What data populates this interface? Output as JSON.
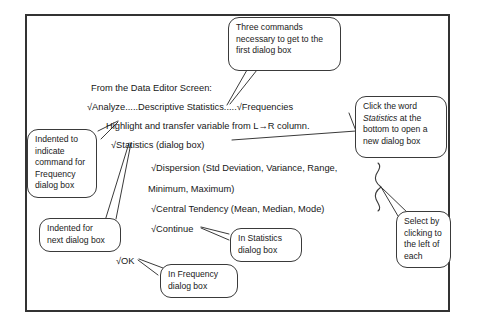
{
  "figure": {
    "background_color": "#ffffff",
    "frame_color": "#333333",
    "text_color": "#171717"
  },
  "body_lines": [
    {
      "id": "intro",
      "text": "From the Data Editor Screen:"
    },
    {
      "id": "commands",
      "text": "√Analyze.....Descriptive Statistics.....√Frequencies"
    },
    {
      "id": "highlight",
      "text": "Highlight and transfer variable from L→R column."
    },
    {
      "id": "statistics",
      "text": "√Statistics (dialog box)"
    },
    {
      "id": "dispersion",
      "text": "√Dispersion (Std Deviation, Variance, Range,"
    },
    {
      "id": "minmax",
      "text": "Minimum, Maximum)"
    },
    {
      "id": "central",
      "text": "√Central Tendency (Mean, Median, Mode)"
    },
    {
      "id": "continue",
      "text": "√Continue"
    },
    {
      "id": "ok",
      "text": "√OK"
    }
  ],
  "callouts": [
    {
      "id": "three-commands",
      "lines": [
        "Three commands",
        "necessary to get to the",
        "first dialog box"
      ]
    },
    {
      "id": "click-the-word",
      "lines_pre": [
        "Click the word"
      ],
      "emphasis": "Statistics",
      "emphasis_suffix": " at the",
      "lines_post": [
        "bottom to open a",
        "new dialog box"
      ]
    },
    {
      "id": "indented-frequency",
      "lines": [
        "Indented to",
        "indicate",
        "command for",
        "Frequency",
        "dialog box"
      ]
    },
    {
      "id": "indented-next",
      "lines": [
        "Indented for",
        "next dialog box"
      ]
    },
    {
      "id": "in-statistics",
      "lines": [
        "In Statistics",
        "dialog box"
      ]
    },
    {
      "id": "in-frequency",
      "lines": [
        "In Frequency",
        "dialog box"
      ]
    },
    {
      "id": "select-by-clicking",
      "lines": [
        "Select by",
        "clicking to",
        "the left of",
        "each"
      ]
    }
  ]
}
